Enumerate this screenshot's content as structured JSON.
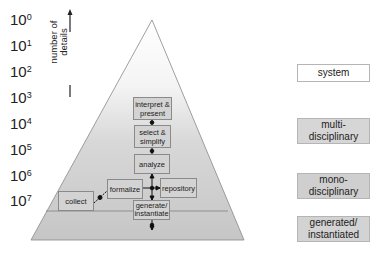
{
  "scale": {
    "base": "10",
    "exponents": [
      "0",
      "1",
      "2",
      "3",
      "4",
      "5",
      "6",
      "7"
    ]
  },
  "axis": {
    "label_line1": "number of",
    "label_line2": "details",
    "arrow": "increasing-up"
  },
  "process_boxes": {
    "interpret": {
      "line1": "interpret &",
      "line2": "present"
    },
    "select": {
      "line1": "select &",
      "line2": "simplify"
    },
    "analyze": {
      "line1": "analyze"
    },
    "formalize": {
      "line1": "formalize"
    },
    "repository": {
      "line1": "repository"
    },
    "collect": {
      "line1": "collect"
    },
    "generate": {
      "line1": "generate/",
      "line2": "instantiate"
    }
  },
  "levels": [
    {
      "line1": "system",
      "line2": ""
    },
    {
      "line1": "multi-",
      "line2": "disciplinary"
    },
    {
      "line1": "mono-",
      "line2": "disciplinary"
    },
    {
      "line1": "generated/",
      "line2": "instantiated"
    }
  ],
  "colors": {
    "box_fill": "#d3d3d3",
    "box_border": "#8a8a8a",
    "pyramid_top": "#ffffff",
    "pyramid_bottom": "#c4c4c4",
    "label_fill_shaded": "#d6d6d6",
    "label_fill_white": "#ffffff"
  }
}
